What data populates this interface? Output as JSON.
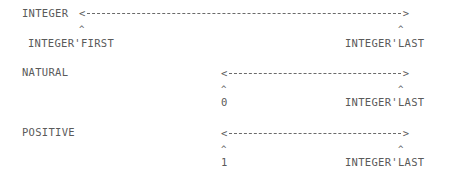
{
  "ranges": [
    {
      "name": "INTEGER",
      "lower_bound": "INTEGER'FIRST",
      "upper_bound": "INTEGER'LAST"
    },
    {
      "name": "NATURAL",
      "lower_bound": "0",
      "upper_bound": "INTEGER'LAST"
    },
    {
      "name": "POSITIVE",
      "lower_bound": "1",
      "upper_bound": "INTEGER'LAST"
    }
  ],
  "symbols": {
    "arrow_left": "<",
    "arrow_right": ">",
    "caret": "^"
  }
}
